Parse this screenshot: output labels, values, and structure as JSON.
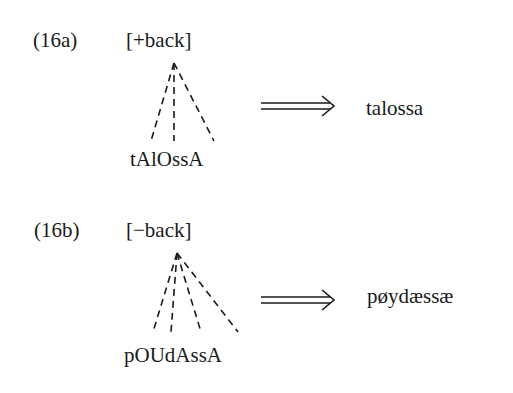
{
  "examples": [
    {
      "label": "(16a)",
      "feature": "[+back]",
      "underlying": "tAlOssA",
      "arrow": "⟹",
      "surface": "talossa",
      "association_lines": 3
    },
    {
      "label": "(16b)",
      "feature": "[−back]",
      "underlying": "pOUdAssA",
      "arrow": "⟹",
      "surface": "pøydæssæ",
      "association_lines": 4
    }
  ]
}
